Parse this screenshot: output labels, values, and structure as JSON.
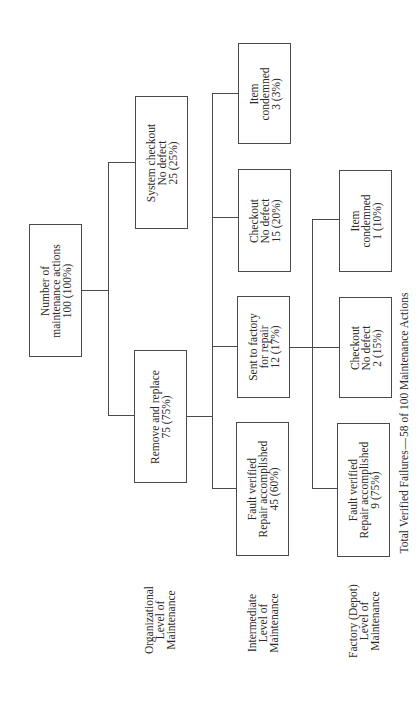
{
  "diagram": {
    "root": {
      "lines": [
        "Number of",
        "maintenance actions",
        "100 (100%)"
      ]
    },
    "organizational": {
      "remove_replace": {
        "lines": [
          "Remove and replace",
          "75 (75%)"
        ]
      },
      "system_checkout": {
        "lines": [
          "System checkout",
          "No defect",
          "25 (25%)"
        ]
      }
    },
    "intermediate": {
      "fault_verified": {
        "lines": [
          "Fault verified",
          "Repair accomplished",
          "45 (60%)"
        ]
      },
      "sent_to_factory": {
        "lines": [
          "Sent to factory",
          "for repair",
          "12 (17%)"
        ]
      },
      "checkout": {
        "lines": [
          "Checkout",
          "No defect",
          "15 (20%)"
        ]
      },
      "item_condemned": {
        "lines": [
          "Item",
          "condemned",
          "3 (3%)"
        ]
      }
    },
    "factory": {
      "fault_verified": {
        "lines": [
          "Fault verified",
          "Repair accomplished",
          "9 (75%)"
        ]
      },
      "checkout": {
        "lines": [
          "Checkout",
          "No defect",
          "2 (15%)"
        ]
      },
      "item_condemned": {
        "lines": [
          "Item",
          "condemned",
          "1 (10%)"
        ]
      }
    },
    "level_labels": [
      {
        "lines": [
          "Organizational",
          "Level of",
          "Maintenance"
        ]
      },
      {
        "lines": [
          "Intermediate",
          "Level of",
          "Maintenance"
        ]
      },
      {
        "lines": [
          "Factory (Depot)",
          "Level of",
          "Maintenance"
        ]
      }
    ],
    "footer": "Total Verified Failures — 58 of 100 Maintenance Actions"
  }
}
